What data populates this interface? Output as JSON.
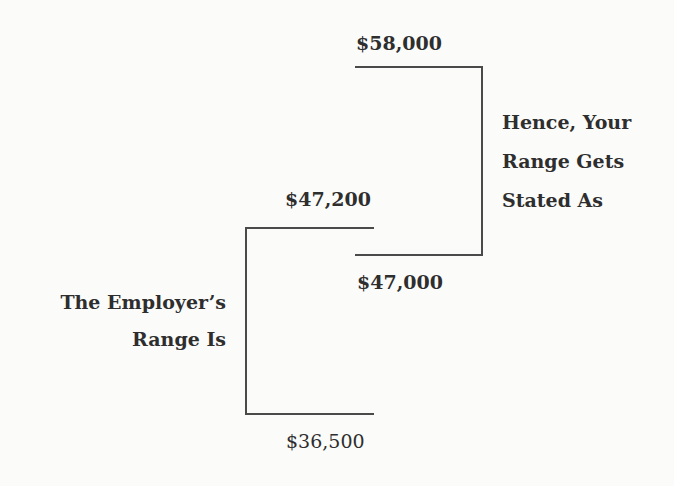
{
  "labels": {
    "your_high": "$58,000",
    "your_low": "$47,000",
    "employer_high": "$47,200",
    "employer_low": "$36,500",
    "your_range_caption": [
      "Hence, Your",
      "Range Gets",
      "Stated As"
    ],
    "employer_range_caption": [
      "The Employer’s",
      "Range Is"
    ]
  },
  "colors": {
    "background": "#fbfbfa",
    "text": "#2e2e2e",
    "line": "#4a4a4a"
  }
}
